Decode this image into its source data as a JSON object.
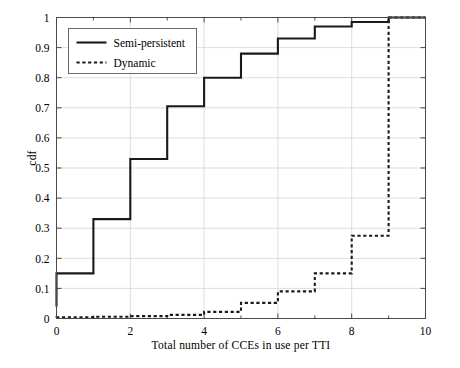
{
  "chart_data": {
    "type": "line",
    "subtype": "step-cdf",
    "title": "",
    "xlabel": "Total number of CCEs in use per TTI",
    "ylabel": "cdf",
    "xlim": [
      0,
      10
    ],
    "ylim": [
      0,
      1
    ],
    "grid": true,
    "legend_position": "upper-left",
    "xticks": [
      0,
      2,
      4,
      6,
      8,
      10
    ],
    "xticklabels": [
      "0",
      "2",
      "4",
      "6",
      "8",
      "10"
    ],
    "xminorticks": [
      1,
      3,
      5,
      7,
      9
    ],
    "yticks": [
      0,
      0.1,
      0.2,
      0.3,
      0.4,
      0.5,
      0.6,
      0.7,
      0.8,
      0.9,
      1
    ],
    "yticklabels": [
      "0",
      "0.1",
      "0.2",
      "0.3",
      "0.4",
      "0.5",
      "0.6",
      "0.7",
      "0.8",
      "0.9",
      "1"
    ],
    "x": [
      0,
      1,
      2,
      3,
      4,
      5,
      6,
      7,
      8,
      9,
      10
    ],
    "series": [
      {
        "name": "Semi-persistent",
        "style": "solid",
        "color": "#1a1a1a",
        "width": 2.1,
        "values": [
          0.04,
          0.15,
          0.33,
          0.53,
          0.705,
          0.8,
          0.88,
          0.93,
          0.97,
          0.985,
          1.0
        ]
      },
      {
        "name": "Dynamic",
        "style": "dotted",
        "color": "#1a1a1a",
        "width": 2.1,
        "values": [
          0.003,
          0.004,
          0.006,
          0.008,
          0.012,
          0.022,
          0.052,
          0.09,
          0.15,
          0.275,
          1.0
        ]
      }
    ]
  },
  "legend": {
    "items": [
      {
        "label": "Semi-persistent",
        "style": "solid"
      },
      {
        "label": "Dynamic",
        "style": "dotted"
      }
    ]
  },
  "axes": {
    "xlabel": "Total number of CCEs in use per TTI",
    "ylabel": "cdf"
  }
}
